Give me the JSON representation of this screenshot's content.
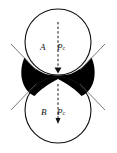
{
  "figure": {
    "type": "diagram",
    "width": 117,
    "height": 153,
    "background_color": "#ffffff",
    "stroke_color": "#111111",
    "fill_color": "#000000",
    "labels": {
      "upper_region": "A",
      "upper_pressure": "P",
      "upper_pressure_subscript": "c",
      "lower_region": "B",
      "lower_pressure": "P",
      "lower_pressure_subscript": "c"
    },
    "geometry": {
      "circle_center_x": 58,
      "circle_radius": 33,
      "upper_circle_center_y": 42,
      "lower_circle_center_y": 110,
      "contact_point_y": 76,
      "axis_x": 58
    }
  }
}
